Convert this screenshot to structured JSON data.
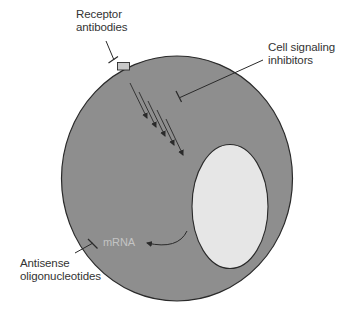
{
  "figure": {
    "type": "cell-therapeutic-targets-diagram",
    "colors": {
      "background": "#ffffff",
      "cytoplasm": "#8e8e8e",
      "nucleus": "#e6e6e6",
      "receptor": "#c8c8c8",
      "outline": "#2a2a2a",
      "label_text": "#333333",
      "mrna_text": "#c4c4c4"
    }
  },
  "labels": {
    "receptor_antibodies": {
      "line1": "Receptor",
      "line2": "antibodies"
    },
    "cell_signaling_inhibitors": {
      "line1": "Cell signaling",
      "line2": "inhibitors"
    },
    "antisense_oligonucleotides": {
      "line1": "Antisense",
      "line2": "oligonucleotides"
    },
    "mrna": "mRNA"
  },
  "elements": {
    "cell": "cell-membrane",
    "nucleus": "nucleus",
    "receptor": "membrane-receptor",
    "signal_arrows_count": 5,
    "mrna_arrow": "curved-arrow-from-nucleus",
    "inhibitor_markers": [
      "receptor-antibody-tbar",
      "signaling-inhibitor-tbar",
      "antisense-tbar"
    ]
  }
}
